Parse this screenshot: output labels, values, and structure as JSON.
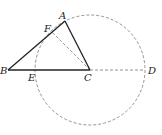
{
  "diagram": {
    "type": "geometry",
    "points": {
      "A": {
        "label": "A",
        "x": 65,
        "y": 21
      },
      "B": {
        "label": "B",
        "x": 8,
        "y": 70
      },
      "C": {
        "label": "C",
        "x": 90,
        "y": 70
      },
      "D": {
        "label": "D",
        "x": 145,
        "y": 70
      },
      "E": {
        "label": "E",
        "x": 36,
        "y": 70
      },
      "F": {
        "label": "F",
        "x": 52,
        "y": 32
      }
    },
    "circle": {
      "center": "C",
      "radius": 55,
      "style": "dashed"
    },
    "solid_segments": [
      "AB",
      "BC",
      "AC"
    ],
    "dashed_segments": [
      "CF",
      "CD"
    ],
    "colors": {
      "solid": "#222222",
      "dashed": "#777777"
    }
  }
}
